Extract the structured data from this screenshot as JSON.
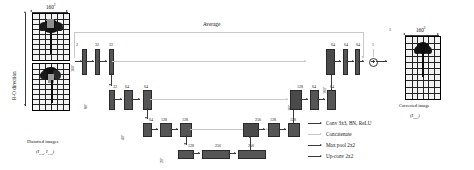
{
  "figure": {
    "type": "diagram",
    "top_label": "Average"
  },
  "input": {
    "size_label": "160",
    "size_sup": "2",
    "ro_direction": "R-O direction",
    "caption_line1": "Distorted images",
    "caption_line2_pre": "(I",
    "caption_sub1": "PA0",
    "caption_mid": ", I",
    "caption_sub2": "NA0",
    "caption_close": ")"
  },
  "output": {
    "size_label": "160",
    "size_sup": "2",
    "caption_line1": "Corrected image",
    "caption_line2_pre": "(I",
    "caption_sub": "PRE",
    "caption_close": ")"
  },
  "levels": {
    "l1": {
      "res": "160",
      "res_sup": "2"
    },
    "l2": {
      "res": "80",
      "res_sup": "2"
    },
    "l3": {
      "res": "40",
      "res_sup": "2"
    },
    "l4": {
      "res": "20",
      "res_sup": "2"
    }
  },
  "encoder": {
    "level1": [
      "2",
      "32",
      "32"
    ],
    "level2": [
      "32",
      "64",
      "64"
    ],
    "level3": [
      "64",
      "128",
      "128"
    ],
    "level4": [
      "128",
      "256",
      "256"
    ]
  },
  "decoder": {
    "level3": [
      "256",
      "128",
      "128"
    ],
    "level2": [
      "128",
      "64",
      "64"
    ],
    "level1": [
      "64",
      "64",
      "64",
      "1"
    ]
  },
  "legend": {
    "items": [
      {
        "label": "Conv 3x3, BN, ReLU",
        "style": "solid"
      },
      {
        "label": "Concatenate",
        "style": "gray"
      },
      {
        "label": "Max pool 2x2",
        "style": "solid"
      },
      {
        "label": "Up-conv 2x2",
        "style": "solid"
      }
    ]
  },
  "colors": {
    "feature_bar": "#555555",
    "arrow": "#3a3a3a",
    "skip": "#c9c9c9",
    "text": "#111111"
  }
}
